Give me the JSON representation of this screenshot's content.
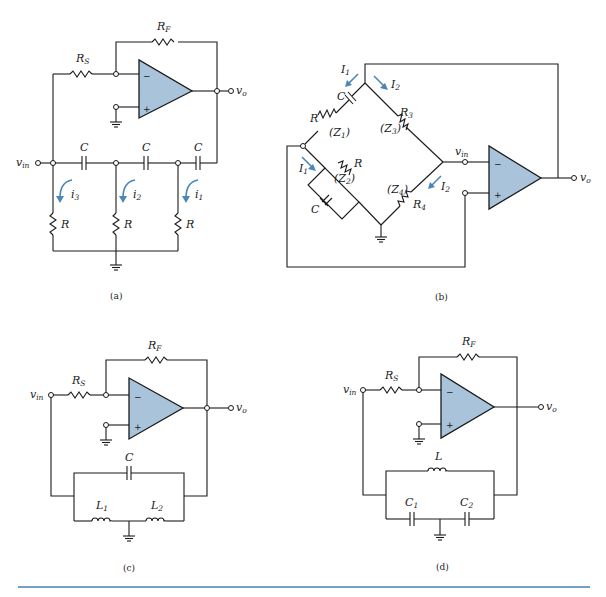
{
  "figure": {
    "panels": [
      {
        "id": "a",
        "caption": "(a)",
        "type": "RC phase-shift oscillator",
        "labels": {
          "rf": "R",
          "rf_sub": "F",
          "rs": "R",
          "rs_sub": "S",
          "vin": "v",
          "vin_sub": "in",
          "vo": "v",
          "vo_sub": "o",
          "c1": "C",
          "c2": "C",
          "c3": "C",
          "r1": "R",
          "r2": "R",
          "r3": "R",
          "i3": "i",
          "i3_sub": "3",
          "i2": "i",
          "i2_sub": "2",
          "i1": "i",
          "i1_sub": "1"
        },
        "opamp": {
          "minus": "−",
          "plus": "+"
        }
      },
      {
        "id": "b",
        "caption": "(b)",
        "type": "Wien-bridge oscillator",
        "labels": {
          "I1": "I",
          "I1_sub": "1",
          "I2": "I",
          "I2_sub": "2",
          "C_top": "C",
          "R_top": "R",
          "Z1": "(Z",
          "Z1_sub": "1",
          "Z1_close": ")",
          "R3": "R",
          "R3_sub": "3",
          "Z3": "(Z",
          "Z3_sub": "3",
          "Z3_close": ")",
          "Z2": "(Z",
          "Z2_sub": "2",
          "Z2_close": ")",
          "R_par": "R",
          "C_par": "C",
          "Z4": "(Z",
          "Z4_sub": "4",
          "Z4_close": ")",
          "R4": "R",
          "R4_sub": "4",
          "vin": "v",
          "vin_sub": "in",
          "vo": "v",
          "vo_sub": "o"
        },
        "opamp": {
          "minus": "−",
          "plus": "+"
        }
      },
      {
        "id": "c",
        "caption": "(c)",
        "type": "Hartley oscillator",
        "labels": {
          "rf": "R",
          "rf_sub": "F",
          "rs": "R",
          "rs_sub": "S",
          "vin": "v",
          "vin_sub": "in",
          "vo": "v",
          "vo_sub": "o",
          "c": "C",
          "l1": "L",
          "l1_sub": "1",
          "l2": "L",
          "l2_sub": "2"
        },
        "opamp": {
          "minus": "−",
          "plus": "+"
        }
      },
      {
        "id": "d",
        "caption": "(d)",
        "type": "Colpitts oscillator",
        "labels": {
          "rf": "R",
          "rf_sub": "F",
          "rs": "R",
          "rs_sub": "S",
          "vin": "v",
          "vin_sub": "in",
          "vo": "v",
          "vo_sub": "o",
          "l": "L",
          "c1": "C",
          "c1_sub": "1",
          "c2": "C",
          "c2_sub": "2"
        },
        "opamp": {
          "minus": "−",
          "plus": "+"
        }
      }
    ],
    "colors": {
      "opamp_fill": "#a9c4da",
      "arrow": "#4a86b8",
      "rule": "#4a7fb0"
    }
  }
}
